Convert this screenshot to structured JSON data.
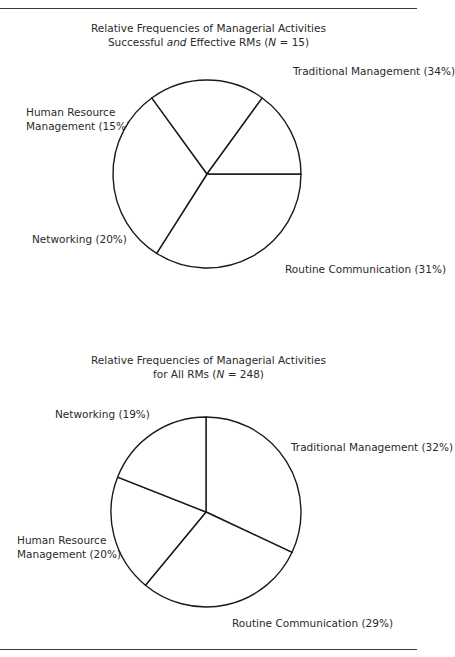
{
  "chart_data": [
    {
      "type": "pie",
      "title": "Relative Frequencies of Managerial Activities",
      "subtitle_parts": [
        "Successful ",
        "and",
        " Effective RMs (",
        "N",
        " = 15)"
      ],
      "subtitle": "Successful and Effective RMs (N = 15)",
      "start": "3 o'clock, clockwise",
      "slices": [
        {
          "label": "Traditional Management (34%)",
          "name": "Traditional Management",
          "value": 34
        },
        {
          "label": "Routine Communication (31%)",
          "name": "Routine Communication",
          "value": 31
        },
        {
          "label": "Networking (20%)",
          "name": "Networking",
          "value": 20
        },
        {
          "label_lines": [
            "Human Resource",
            "Management (15%)"
          ],
          "name": "Human Resource Management",
          "value": 15
        }
      ]
    },
    {
      "type": "pie",
      "title": "Relative Frequencies of Managerial Activities",
      "subtitle_parts": [
        "for All RMs (",
        "N",
        " = 248)"
      ],
      "subtitle": "for All RMs (N = 248)",
      "start": "12 o'clock, clockwise",
      "slices": [
        {
          "label": "Traditional Management (32%)",
          "name": "Traditional Management",
          "value": 32
        },
        {
          "label": "Routine Communication (29%)",
          "name": "Routine Communication",
          "value": 29
        },
        {
          "label_lines": [
            "Human Resource",
            "Management (20%)"
          ],
          "name": "Human Resource Management",
          "value": 20
        },
        {
          "label": "Networking (19%)",
          "name": "Networking",
          "value": 19
        }
      ]
    }
  ]
}
